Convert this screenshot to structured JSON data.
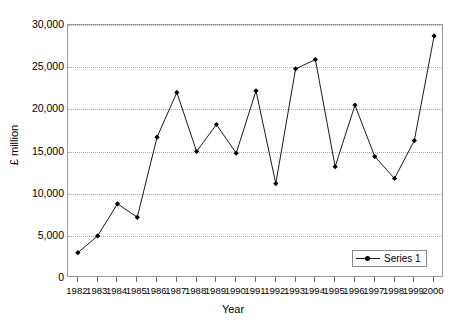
{
  "chart_data": {
    "type": "line",
    "title": "",
    "xlabel": "Year",
    "ylabel": "£ million",
    "x": [
      1982,
      1983,
      1984,
      1985,
      1986,
      1987,
      1988,
      1989,
      1990,
      1991,
      1992,
      1993,
      1994,
      1995,
      1996,
      1997,
      1998,
      1999,
      2000
    ],
    "categories": [
      "1982",
      "1983",
      "1984",
      "1985",
      "1986",
      "1987",
      "1988",
      "1989",
      "1990",
      "1991",
      "1992",
      "1993",
      "1994",
      "1995",
      "1996",
      "1997",
      "1998",
      "1999",
      "2000"
    ],
    "series": [
      {
        "name": "Series 1",
        "values": [
          3000,
          5000,
          8800,
          7200,
          16700,
          22000,
          15000,
          18200,
          14800,
          22200,
          11200,
          24800,
          25900,
          13200,
          20500,
          14400,
          11800,
          16300,
          28700
        ]
      }
    ],
    "ylim": [
      0,
      30000
    ],
    "yticks": [
      0,
      5000,
      10000,
      15000,
      20000,
      25000,
      30000
    ],
    "ytick_labels": [
      "0",
      "5,000",
      "10,000",
      "15,000",
      "20,000",
      "25,000",
      "30,000"
    ],
    "grid": true,
    "grid_style": "dotted-horizontal",
    "legend_position": "bottom-right",
    "marker": "filled-diamond",
    "line_color": "#1a1a1a",
    "marker_color": "#000000",
    "grid_color": "#a9a9a9",
    "frame_color": "#9a9a9a",
    "background": "#ffffff"
  },
  "legend": {
    "entries": [
      {
        "label": "Series 1"
      }
    ]
  }
}
